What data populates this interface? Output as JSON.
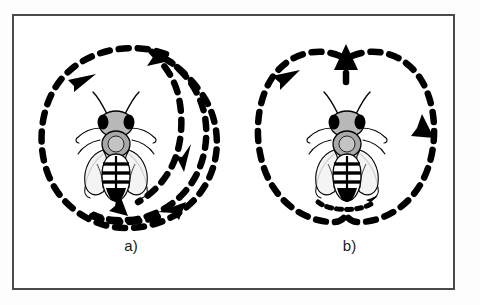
{
  "figure": {
    "border_color": "#4a4a4a",
    "background_color": "#ffffff",
    "ink_color": "#000000"
  },
  "panels": [
    {
      "id": "a",
      "label": "a)",
      "dance_name": "round-dance",
      "subject": "honeybee",
      "path_style": "dashed",
      "arrow_count": 4
    },
    {
      "id": "b",
      "label": "b)",
      "dance_name": "waggle-dance",
      "subject": "honeybee",
      "path_style": "dashed",
      "arrow_count": 4
    }
  ],
  "bee": {
    "body_color": "#ffffff",
    "marking_color": "#000000",
    "shading_color": "#9a9a9a",
    "name": "honeybee-dorsal-view"
  }
}
